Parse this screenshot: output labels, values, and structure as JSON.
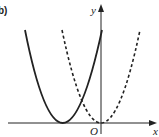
{
  "figure": {
    "part_label": "b)",
    "x_axis_label": "x",
    "y_axis_label": "y",
    "origin_label": "O"
  },
  "curves": [
    {
      "name": "solid-parabola",
      "style": "solid",
      "vertex": "left of origin, on x-axis"
    },
    {
      "name": "dashed-parabola",
      "style": "dashed",
      "vertex": "at origin"
    }
  ],
  "colors": {
    "stroke": "#222222",
    "background": "#ffffff"
  }
}
